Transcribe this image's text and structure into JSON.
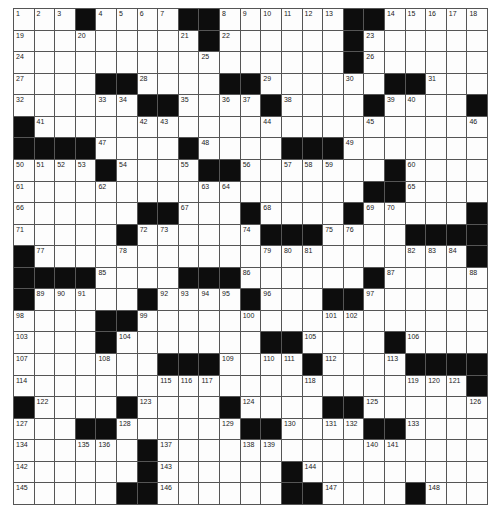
{
  "puzzle": {
    "rows": 23,
    "cols": 23,
    "legend": {
      "#": "black square",
      ".": "empty white square",
      "number": "numbered white square"
    },
    "grid": [
      [
        "1",
        "2",
        "3",
        "#",
        "4",
        "5",
        "6",
        "7",
        "#",
        "#",
        "8",
        "9",
        "10",
        "11",
        "12",
        "13",
        "#",
        "#",
        "14",
        "15",
        "16",
        "17",
        "18"
      ],
      [
        "19",
        ".",
        ".",
        "20",
        ".",
        ".",
        ".",
        ".",
        "21",
        "#",
        "22",
        ".",
        ".",
        ".",
        ".",
        ".",
        "#",
        "23",
        ".",
        ".",
        ".",
        ".",
        "."
      ],
      [
        "24",
        ".",
        ".",
        ".",
        ".",
        ".",
        ".",
        ".",
        ".",
        "25",
        ".",
        ".",
        ".",
        ".",
        ".",
        ".",
        "#",
        "26",
        ".",
        ".",
        ".",
        ".",
        "."
      ],
      [
        "27",
        ".",
        ".",
        ".",
        "#",
        "#",
        "28",
        ".",
        ".",
        ".",
        "#",
        "#",
        "29",
        ".",
        ".",
        ".",
        "30",
        ".",
        "#",
        "#",
        "31",
        ".",
        "."
      ],
      [
        "32",
        ".",
        ".",
        ".",
        "33",
        "34",
        "#",
        "#",
        "35",
        ".",
        "36",
        "37",
        "#",
        "38",
        ".",
        ".",
        ".",
        "#",
        "39",
        "40",
        ".",
        ".",
        "#"
      ],
      [
        "#",
        "41",
        ".",
        ".",
        ".",
        ".",
        "42",
        "43",
        ".",
        ".",
        ".",
        ".",
        "44",
        ".",
        ".",
        ".",
        ".",
        "45",
        ".",
        ".",
        ".",
        ".",
        "46"
      ],
      [
        "#",
        "#",
        "#",
        "#",
        "47",
        ".",
        ".",
        ".",
        "#",
        "48",
        ".",
        ".",
        ".",
        "#",
        "#",
        "#",
        "49",
        ".",
        ".",
        ".",
        ".",
        ".",
        "."
      ],
      [
        "50",
        "51",
        "52",
        "53",
        "#",
        "54",
        ".",
        ".",
        "55",
        "#",
        "#",
        "56",
        ".",
        "57",
        "58",
        "59",
        ".",
        ".",
        "#",
        "60",
        ".",
        ".",
        "."
      ],
      [
        "61",
        ".",
        ".",
        ".",
        "62",
        ".",
        ".",
        ".",
        ".",
        "63",
        "64",
        ".",
        ".",
        ".",
        ".",
        ".",
        ".",
        "#",
        "#",
        "65",
        ".",
        ".",
        "."
      ],
      [
        "66",
        ".",
        ".",
        ".",
        ".",
        ".",
        "#",
        "#",
        "67",
        ".",
        ".",
        "#",
        "68",
        ".",
        ".",
        ".",
        "#",
        "69",
        "70",
        ".",
        ".",
        ".",
        "#"
      ],
      [
        "71",
        ".",
        ".",
        ".",
        ".",
        "#",
        "72",
        "73",
        ".",
        ".",
        ".",
        "74",
        "#",
        "#",
        "#",
        "75",
        "76",
        ".",
        ".",
        "#",
        "#",
        "#",
        "#"
      ],
      [
        "#",
        "77",
        ".",
        ".",
        ".",
        "78",
        ".",
        ".",
        ".",
        ".",
        ".",
        ".",
        "79",
        "80",
        "81",
        ".",
        ".",
        ".",
        ".",
        "82",
        "83",
        "84",
        "#"
      ],
      [
        "#",
        "#",
        "#",
        "#",
        "85",
        ".",
        ".",
        ".",
        "#",
        "#",
        "#",
        "86",
        ".",
        ".",
        ".",
        ".",
        ".",
        "#",
        "87",
        ".",
        ".",
        ".",
        "88"
      ],
      [
        "#",
        "89",
        "90",
        "91",
        ".",
        ".",
        "#",
        "92",
        "93",
        "94",
        "95",
        "#",
        "96",
        ".",
        ".",
        "#",
        "#",
        "97",
        ".",
        ".",
        ".",
        ".",
        "."
      ],
      [
        "98",
        ".",
        ".",
        ".",
        "#",
        "#",
        "99",
        ".",
        ".",
        ".",
        ".",
        "100",
        ".",
        ".",
        ".",
        "101",
        "102",
        ".",
        ".",
        ".",
        ".",
        ".",
        "."
      ],
      [
        "103",
        ".",
        ".",
        ".",
        "#",
        "104",
        ".",
        ".",
        ".",
        ".",
        ".",
        ".",
        "#",
        "#",
        "105",
        ".",
        ".",
        ".",
        "#",
        "106",
        ".",
        ".",
        "."
      ],
      [
        "107",
        ".",
        ".",
        ".",
        "108",
        ".",
        ".",
        "#",
        "#",
        "#",
        "109",
        ".",
        "110",
        "111",
        "#",
        "112",
        ".",
        ".",
        "113",
        "#",
        "#",
        "#",
        "#"
      ],
      [
        "114",
        ".",
        ".",
        ".",
        ".",
        ".",
        ".",
        "115",
        "116",
        "117",
        ".",
        ".",
        ".",
        ".",
        "118",
        ".",
        ".",
        ".",
        ".",
        "119",
        "120",
        "121",
        "#"
      ],
      [
        "#",
        "122",
        ".",
        ".",
        ".",
        "#",
        "123",
        ".",
        ".",
        ".",
        "#",
        "124",
        ".",
        ".",
        ".",
        "#",
        "#",
        "125",
        ".",
        ".",
        ".",
        ".",
        "126"
      ],
      [
        "127",
        ".",
        ".",
        "#",
        "#",
        "128",
        ".",
        ".",
        ".",
        ".",
        "129",
        "#",
        "#",
        "130",
        ".",
        "131",
        "132",
        "#",
        "#",
        "133",
        ".",
        ".",
        "."
      ],
      [
        "134",
        ".",
        ".",
        "135",
        "136",
        ".",
        "#",
        "137",
        ".",
        ".",
        ".",
        "138",
        "139",
        ".",
        ".",
        ".",
        ".",
        "140",
        "141",
        ".",
        ".",
        ".",
        "."
      ],
      [
        "142",
        ".",
        ".",
        ".",
        ".",
        ".",
        "#",
        "143",
        ".",
        ".",
        ".",
        ".",
        ".",
        "#",
        "144",
        ".",
        ".",
        ".",
        ".",
        ".",
        ".",
        ".",
        "."
      ],
      [
        "145",
        ".",
        ".",
        ".",
        ".",
        "#",
        "#",
        "146",
        ".",
        ".",
        ".",
        ".",
        ".",
        "#",
        "#",
        "147",
        ".",
        ".",
        ".",
        "#",
        "148",
        ".",
        "."
      ]
    ]
  },
  "colors": {
    "black_square": "#0d0d0d",
    "white_square": "#fdfdfd",
    "grid_line": "#555555"
  }
}
